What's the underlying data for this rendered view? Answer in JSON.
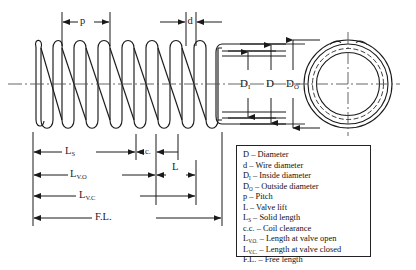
{
  "dimensions": {
    "pitch": "p",
    "wire_diameter": "d",
    "inside_diameter": "D",
    "inside_diameter_sub": "I",
    "mean_diameter": "D",
    "outside_diameter": "D",
    "outside_diameter_sub": "O",
    "solid_length": "L",
    "solid_length_sub": "S",
    "coil_clearance": "c.c.",
    "valve_lift": "L",
    "length_valve_open": "L",
    "length_valve_open_sub": "V.O",
    "length_valve_closed": "L",
    "length_valve_closed_sub": "V.C",
    "free_length": "F.L."
  },
  "legend": {
    "entries": [
      {
        "symbol": "D",
        "sub": "",
        "text": "– Diameter"
      },
      {
        "symbol": "d",
        "sub": "",
        "text": "– Wire diameter"
      },
      {
        "symbol": "D",
        "sub": "I",
        "text": "– Inside diameter"
      },
      {
        "symbol": "D",
        "sub": "O",
        "text": "– Outside diameter"
      },
      {
        "symbol": "p",
        "sub": "",
        "text": "– Pitch"
      },
      {
        "symbol": "L",
        "sub": "",
        "text": "– Valve lift"
      },
      {
        "symbol": "L",
        "sub": "S",
        "text": "– Solid length"
      },
      {
        "symbol": "c.c.",
        "sub": "",
        "text": "– Coil clearance"
      },
      {
        "symbol": "L",
        "sub": "V.O.",
        "text": "– Length at valve open"
      },
      {
        "symbol": "L",
        "sub": "V.C.",
        "text": "– Length at valve closed"
      },
      {
        "symbol": "F.L.",
        "sub": "",
        "text": "– Free length"
      }
    ]
  },
  "colors": {
    "line": "#1a1a1a",
    "centerline": "#555555",
    "background": "#ffffff"
  }
}
